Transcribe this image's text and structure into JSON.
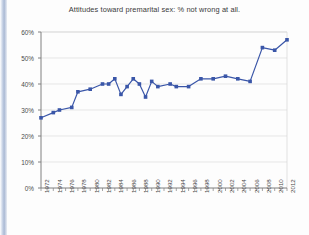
{
  "chart_data": {
    "type": "line",
    "title": "Attitudes toward premarital sex: % not wrong at all.",
    "xlabel": "",
    "ylabel": "",
    "ylim": [
      0,
      60
    ],
    "yticks": [
      0,
      10,
      20,
      30,
      40,
      50,
      60
    ],
    "ytick_labels": [
      "0%",
      "10%",
      "20%",
      "30%",
      "40%",
      "50%",
      "60%"
    ],
    "xlim": [
      1972,
      2012
    ],
    "xtick_labels": [
      "1972",
      "1974",
      "1976",
      "1978",
      "1980",
      "1982",
      "1984",
      "1986",
      "1988",
      "1990",
      "1992",
      "1994",
      "1996",
      "1998",
      "2000",
      "2002",
      "2004",
      "2006",
      "2008",
      "2010",
      "2012"
    ],
    "grid": true,
    "legend": false,
    "marker": "square",
    "series": [
      {
        "name": "% not wrong at all",
        "color": "#3a56a8",
        "points": [
          {
            "x": 1972,
            "y": 27
          },
          {
            "x": 1974,
            "y": 29
          },
          {
            "x": 1975,
            "y": 30
          },
          {
            "x": 1977,
            "y": 31
          },
          {
            "x": 1978,
            "y": 37
          },
          {
            "x": 1980,
            "y": 38
          },
          {
            "x": 1982,
            "y": 40
          },
          {
            "x": 1983,
            "y": 40
          },
          {
            "x": 1984,
            "y": 42
          },
          {
            "x": 1985,
            "y": 36
          },
          {
            "x": 1986,
            "y": 39
          },
          {
            "x": 1987,
            "y": 42
          },
          {
            "x": 1988,
            "y": 40
          },
          {
            "x": 1989,
            "y": 35
          },
          {
            "x": 1990,
            "y": 41
          },
          {
            "x": 1991,
            "y": 39
          },
          {
            "x": 1993,
            "y": 40
          },
          {
            "x": 1994,
            "y": 39
          },
          {
            "x": 1996,
            "y": 39
          },
          {
            "x": 1998,
            "y": 42
          },
          {
            "x": 2000,
            "y": 42
          },
          {
            "x": 2002,
            "y": 43
          },
          {
            "x": 2004,
            "y": 42
          },
          {
            "x": 2006,
            "y": 41
          },
          {
            "x": 2008,
            "y": 54
          },
          {
            "x": 2010,
            "y": 53
          },
          {
            "x": 2012,
            "y": 57
          }
        ]
      }
    ]
  },
  "colors": {
    "series": "#3a56a8",
    "axis": "#808080",
    "grid": "#d9d9d9",
    "text": "#3a3a3a"
  }
}
